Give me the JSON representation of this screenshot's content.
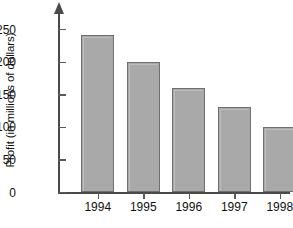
{
  "chart_data": {
    "type": "bar",
    "title": "",
    "xlabel": "",
    "ylabel": "Profit (in millions of dollars)",
    "categories": [
      "1994",
      "1995",
      "1996",
      "1997",
      "1998"
    ],
    "values": [
      240,
      200,
      160,
      130,
      100
    ],
    "ylim": [
      0,
      260
    ],
    "yticks": [
      0,
      50,
      100,
      150,
      200,
      250
    ],
    "ytick_labels": [
      "0",
      "50",
      "100",
      "150",
      "200",
      "250"
    ],
    "grid": false,
    "legend": null,
    "bar_fill_color": "#a9a9a9",
    "bar_edge_color": "#6f6f6f",
    "axis_color": "#4a4a4a",
    "background_color": "#ffffff"
  }
}
